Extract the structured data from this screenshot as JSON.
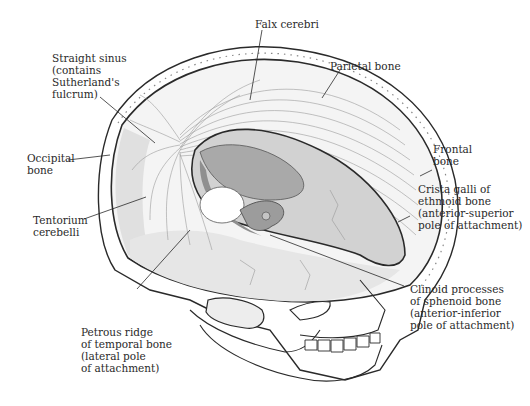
{
  "figure": {
    "colors": {
      "line": "#2a2a2a",
      "light_fill": "#e6e6e6",
      "mid_fill": "#bdbdbd",
      "dark_fill": "#8f8f8f",
      "background": "#ffffff"
    }
  },
  "labels": [
    {
      "id": "falx-cerebri",
      "text": "Falx cerebri"
    },
    {
      "id": "parietal-bone",
      "text": "Parietal bone"
    },
    {
      "id": "straight-sinus",
      "text": "Straight sinus\n(contains\nSutherland's\nfulcrum)"
    },
    {
      "id": "frontal-bone",
      "text": "Frontal\nbone"
    },
    {
      "id": "occipital-bone",
      "text": "Occipital\nbone"
    },
    {
      "id": "crista-galli",
      "text": "Crista galli of\nethmoid bone\n(anterior-superior\npole of attachment)"
    },
    {
      "id": "tentorium-cerebelli",
      "text": "Tentorium\ncerebelli"
    },
    {
      "id": "clinoid-processes",
      "text": "Clinoid processes\nof sphenoid bone\n(anterior-inferior\npole of attachment)"
    },
    {
      "id": "petrous-ridge",
      "text": "Petrous ridge\nof temporal bone\n(lateral pole\nof attachment)"
    }
  ]
}
